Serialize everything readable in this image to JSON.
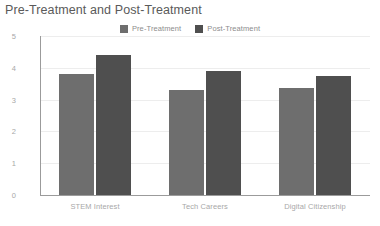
{
  "chart_data": {
    "type": "bar",
    "title": "Pre-Treatment and Post-Treatment",
    "xlabel": "",
    "ylabel": "",
    "categories": [
      "STEM Interest",
      "Tech Careers",
      "Digital Citizenship"
    ],
    "series": [
      {
        "name": "Pre-Treatment",
        "color": "#6e6e6e",
        "values": [
          3.8,
          3.3,
          3.35
        ]
      },
      {
        "name": "Post-Treatment",
        "color": "#4f4f4f",
        "values": [
          4.4,
          3.9,
          3.75
        ]
      }
    ],
    "ylim": [
      0,
      5
    ],
    "yticks": [
      0,
      1,
      2,
      3,
      4,
      5
    ],
    "ytick_labels": [
      "0",
      "1",
      "2",
      "3",
      "4",
      "5"
    ],
    "grid": true,
    "grid_axis": "y",
    "legend_position": "top-center",
    "axis_color": "#9b9b9b",
    "grid_color": "#ededed",
    "tick_label_color": "#a8a8a8",
    "title_color": "#5a5a5a",
    "background": "#ffffff"
  },
  "legend": {
    "items": [
      {
        "label": "Pre-Treatment",
        "color": "#6e6e6e"
      },
      {
        "label": "Post-Treatment",
        "color": "#4f4f4f"
      }
    ]
  }
}
